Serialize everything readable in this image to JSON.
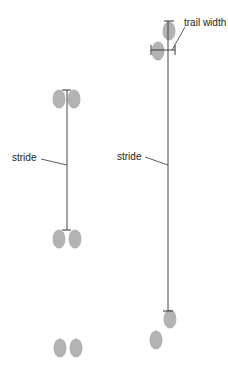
{
  "diagram": {
    "title": "",
    "colors": {
      "print": "#b3b3b3",
      "line": "#333333",
      "text": "#222222"
    },
    "labels": {
      "left_stride": "stride",
      "right_stride": "stride",
      "trail_width": "trail width"
    },
    "left_trail": {
      "pattern": "paired prints (bound)",
      "groups": [
        {
          "y": 102,
          "prints": [
            {
              "x": 59
            },
            {
              "x": 74
            }
          ]
        },
        {
          "y": 240,
          "prints": [
            {
              "x": 59
            },
            {
              "x": 74
            }
          ]
        },
        {
          "y": 348,
          "prints": [
            {
              "x": 60
            },
            {
              "x": 76
            }
          ]
        }
      ]
    },
    "right_trail": {
      "pattern": "alternating prints (walk)",
      "prints": [
        {
          "x": 169,
          "y": 31
        },
        {
          "x": 158,
          "y": 51
        },
        {
          "x": 170,
          "y": 320
        },
        {
          "x": 156,
          "y": 340
        }
      ]
    }
  }
}
